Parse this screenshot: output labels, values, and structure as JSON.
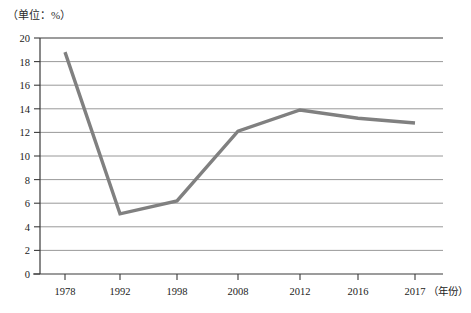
{
  "unit_label": "（单位：%）",
  "colors": {
    "series": "#808080",
    "grid": "#8d8d8d",
    "axis": "#3a3a3a",
    "text": "#222222",
    "background": "#ffffff"
  },
  "axis": {
    "x_title": "（年份）",
    "y_ticks": [
      "0",
      "2",
      "4",
      "6",
      "8",
      "10",
      "12",
      "14",
      "16",
      "18",
      "20"
    ],
    "x_ticks": [
      "1978",
      "1992",
      "1998",
      "2008",
      "2012",
      "2016",
      "2017"
    ]
  },
  "chart_data": {
    "type": "line",
    "title": "",
    "subtitle": "",
    "xlabel": "（年份）",
    "ylabel": "（单位：%）",
    "categories": [
      "1978",
      "1992",
      "1998",
      "2008",
      "2012",
      "2016",
      "2017"
    ],
    "values": [
      18.8,
      5.1,
      6.2,
      12.1,
      13.9,
      13.2,
      12.8
    ],
    "series": [
      {
        "name": "",
        "values": [
          18.8,
          5.1,
          6.2,
          12.1,
          13.9,
          13.2,
          12.8
        ]
      }
    ],
    "ylim": [
      0,
      20
    ],
    "ytick_step": 2,
    "grid": true,
    "grid_axis": "y",
    "legend": "none",
    "annotations": []
  }
}
